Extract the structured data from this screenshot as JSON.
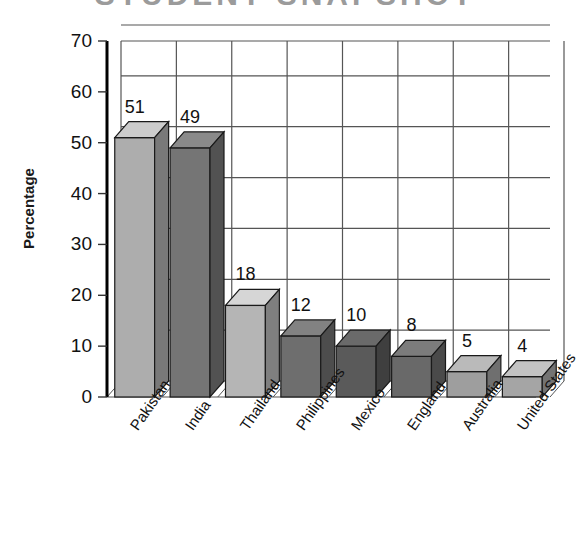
{
  "chart_data": {
    "type": "bar",
    "title": "STUDENT SNAPSHOT",
    "subtitle": "",
    "xlabel": "",
    "ylabel": "Percentage",
    "categories": [
      "Pakistan",
      "India",
      "Thailand",
      "Philippines",
      "Mexico",
      "England",
      "Australia",
      "United States"
    ],
    "values": [
      51,
      49,
      18,
      12,
      10,
      8,
      5,
      4
    ],
    "value_labels": [
      "51",
      "49",
      "18",
      "12",
      "10",
      "8",
      "5",
      "4"
    ],
    "ylim": [
      0,
      70
    ],
    "yticks": [
      0,
      10,
      20,
      30,
      40,
      50,
      60,
      70
    ],
    "ytick_labels": [
      "0",
      "10",
      "20",
      "30",
      "40",
      "50",
      "60",
      "70"
    ],
    "grid": true,
    "grid_style": "both-axes-rectangular",
    "legend": "none",
    "style": "3d-isometric-bars",
    "bar_colors": [
      "#adadad",
      "#757575",
      "#b5b5b5",
      "#6e6e6e",
      "#5a5a5a",
      "#696969",
      "#9e9e9e",
      "#a5a5a5"
    ]
  },
  "axis": {
    "y_title": "Percentage"
  }
}
